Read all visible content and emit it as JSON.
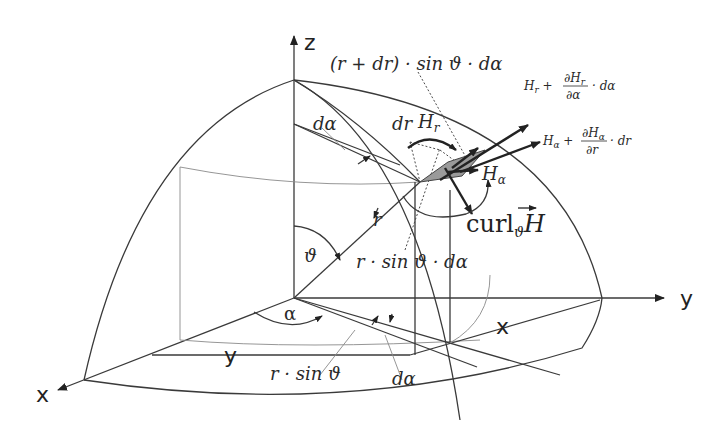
{
  "axes": {
    "x_label": "x",
    "y_label": "y",
    "z_label": "z",
    "x_label_floor": "x",
    "y_label_floor": "y"
  },
  "labels": {
    "top_arc": "(r + dr) · sin ϑ · dα",
    "d_alpha_top": "dα",
    "dr": "dr",
    "H_r": "Hr",
    "H_alpha": "Hα",
    "r": "r",
    "theta": "ϑ",
    "alpha": "α",
    "arc_mid": "r · sin ϑ · dα",
    "r_sin_theta": "r · sin ϑ",
    "d_alpha_bottom": "dα",
    "curl": "curlϑH"
  },
  "formulas": {
    "Hr_plus": {
      "lhs": "Hr +",
      "num": "∂Hr",
      "den": "∂α",
      "tail": "· dα"
    },
    "Ha_plus": {
      "lhs": "Hα +",
      "num": "∂Hα",
      "den": "∂r",
      "tail": "· dr"
    }
  },
  "colors": {
    "line": "#3a3a3a",
    "shaded_patch": "#9a9a9a",
    "background": "#ffffff"
  }
}
